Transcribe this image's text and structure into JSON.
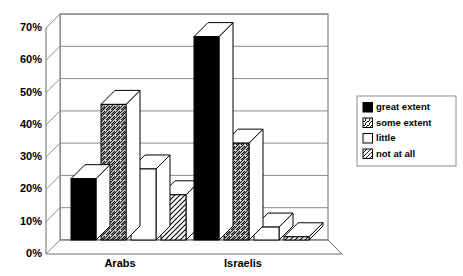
{
  "chart_data": {
    "type": "bar",
    "title": "",
    "subtitle": "",
    "xlabel": "",
    "ylabel": "",
    "categories": [
      "Arabs",
      "Israelis"
    ],
    "series": [
      {
        "name": "great extent",
        "values": [
          19,
          63
        ],
        "pattern": "solid-black",
        "color": "#000000"
      },
      {
        "name": "some extent",
        "values": [
          42,
          30
        ],
        "pattern": "hatch-forward",
        "color": "#ffffff"
      },
      {
        "name": "little",
        "values": [
          22,
          4
        ],
        "pattern": "blank-white",
        "color": "#ffffff"
      },
      {
        "name": "not at all",
        "values": [
          14,
          1
        ],
        "pattern": "hatch-backward",
        "color": "#ffffff"
      }
    ],
    "ylim": [
      0,
      70
    ],
    "ytick_values": [
      0,
      10,
      20,
      30,
      40,
      50,
      60,
      70
    ],
    "ytick_labels": [
      "0%",
      "10%",
      "20%",
      "30%",
      "40%",
      "50%",
      "60%",
      "70%"
    ],
    "grid": true,
    "grid_axis": "y",
    "legend_position": "right",
    "three_d": true,
    "value_suffix": "%"
  },
  "legend": {
    "items": [
      {
        "label": "great extent"
      },
      {
        "label": "some extent"
      },
      {
        "label": "little"
      },
      {
        "label": "not at all"
      }
    ]
  },
  "axis": {
    "y_labels": [
      "70%",
      "60%",
      "50%",
      "40%",
      "30%",
      "20%",
      "10%",
      "0%"
    ]
  },
  "categories": [
    {
      "label": "Arabs"
    },
    {
      "label": "Israelis"
    }
  ],
  "colors": {
    "bar_fill_dark": "#000000",
    "bar_fill_light": "#ffffff",
    "outline": "#000000",
    "gridline": "#8a8a8a",
    "wall": "#6a6a6a",
    "background": "#ffffff"
  }
}
